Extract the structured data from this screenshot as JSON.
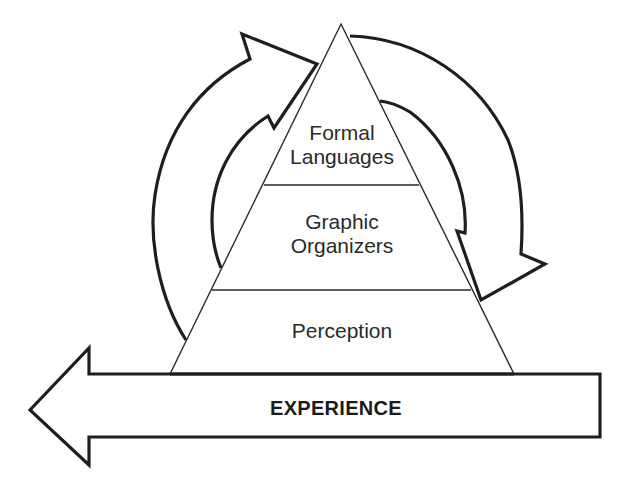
{
  "diagram": {
    "type": "pyramid-with-cycle-arrows",
    "pyramid": {
      "levels": [
        {
          "position": "top",
          "lines": [
            "Formal",
            "Languages"
          ]
        },
        {
          "position": "middle",
          "lines": [
            "Graphic",
            "Organizers"
          ]
        },
        {
          "position": "bottom",
          "lines": [
            "Perception"
          ]
        }
      ]
    },
    "base_arrow": {
      "label": "EXPERIENCE",
      "direction": "left"
    },
    "cycle_arrows": [
      {
        "side": "left",
        "direction": "up-toward-apex"
      },
      {
        "side": "right",
        "direction": "down-away-from-apex"
      }
    ],
    "colors": {
      "stroke": "#1e1e1e",
      "background": "#ffffff",
      "text": "#2a2a2a"
    }
  }
}
